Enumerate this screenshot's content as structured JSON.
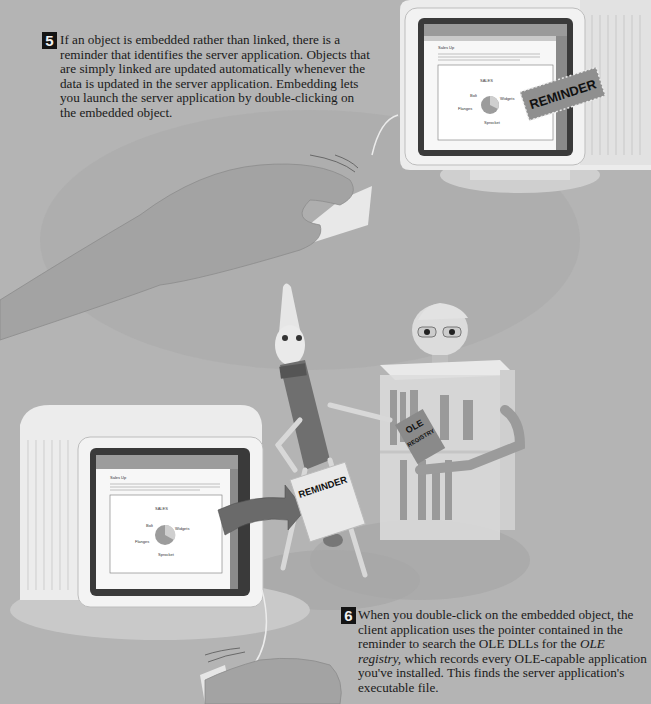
{
  "step5": {
    "number": "5",
    "text": "If an object is embedded rather than linked, there is a reminder that identifies the server application. Objects that are simply linked are updated automatically whenever the data is updated in the server application. Embedding lets you launch the server application by double-clicking on the embedded object."
  },
  "step6": {
    "number": "6",
    "text_before": "When you double-click on the embedded object, the client application uses the pointer contained in the reminder to search the OLE DLLs for the ",
    "text_italic": "OLE registry,",
    "text_after": " which records every OLE-capable application you've installed. This finds the server application's executable file."
  },
  "illustration": {
    "reminder_tag_top": "REMINDER",
    "reminder_tag_bottom": "REMINDER",
    "book_title_line1": "OLE",
    "book_title_line2": "REGISTRY",
    "screen_top": {
      "doc_title": "Sales Up",
      "chart_title": "SALES",
      "pie_labels": [
        "Bolt",
        "Widgets",
        "Flanges",
        "Sprocket"
      ]
    },
    "screen_bottom": {
      "doc_title": "Sales Up",
      "chart_title": "SALES",
      "pie_labels": [
        "Bolt",
        "Widgets",
        "Flanges",
        "Sprocket"
      ]
    }
  },
  "colors": {
    "background": "#b4b4b4",
    "step_badge": "#141414",
    "monitor": "#ececec",
    "screen_frame": "#3a3a3a",
    "arrow": "#6a6a6a"
  }
}
